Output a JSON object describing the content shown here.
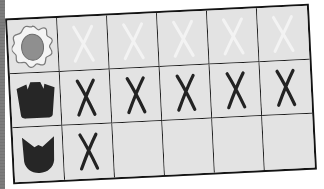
{
  "board": {
    "columns": 6,
    "rows": [
      {
        "icon": "flower-icon",
        "icon_color": "#8f8f8f",
        "marks": [
          "faint-x",
          "faint-x",
          "faint-x",
          "faint-x",
          "faint-x"
        ]
      },
      {
        "icon": "crown-cup-icon",
        "icon_color": "#262626",
        "marks": [
          "x",
          "x",
          "x",
          "x",
          "x"
        ]
      },
      {
        "icon": "shield-cup-icon",
        "icon_color": "#262626",
        "marks": [
          "x",
          "empty",
          "empty",
          "empty",
          "empty"
        ]
      }
    ]
  },
  "colors": {
    "cell_background": "#e3e3e3",
    "grid_line": "#1c1c1c",
    "mark_dark": "#232323",
    "mark_faint": "#f2f2f2"
  }
}
